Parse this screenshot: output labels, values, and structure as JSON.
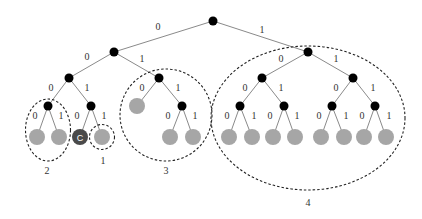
{
  "diagram": {
    "type": "binary-tree",
    "colors": {
      "internal_node": "#000000",
      "leaf_node": "#a6a6a6",
      "special_node": "#4a4a4a",
      "edge": "#8a8a8a"
    },
    "edge_labels": {
      "left": "0",
      "right": "1"
    },
    "special_node_label": "C",
    "groups": [
      {
        "id": "group-2",
        "label": "2"
      },
      {
        "id": "group-1",
        "label": "1"
      },
      {
        "id": "group-3",
        "label": "3"
      },
      {
        "id": "group-4",
        "label": "4"
      }
    ]
  }
}
